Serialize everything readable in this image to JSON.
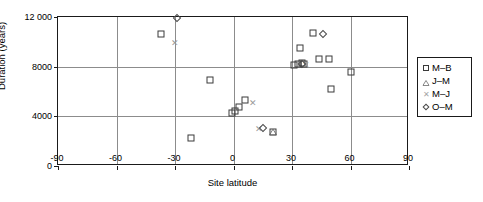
{
  "chart_data": {
    "type": "scatter",
    "title": "",
    "xlabel": "Site latitude",
    "ylabel": "Duration (years)",
    "xlim": [
      -90,
      90
    ],
    "ylim": [
      0,
      12000
    ],
    "xticks": [
      "-90",
      "-60",
      "-30",
      "0",
      "30",
      "60",
      "90"
    ],
    "xtick_values": [
      -90,
      -60,
      -30,
      0,
      30,
      60,
      90
    ],
    "yticks": [
      "0",
      "4000",
      "8000",
      "12 000"
    ],
    "ytick_values": [
      0,
      4000,
      8000,
      12000
    ],
    "grid": true,
    "legend_position": "right",
    "series": [
      {
        "name": "M–B",
        "marker": "square",
        "points": [
          [
            -37,
            10600
          ],
          [
            -22,
            2250
          ],
          [
            -12,
            6900
          ],
          [
            -1,
            4300
          ],
          [
            1,
            4450
          ],
          [
            3,
            4750
          ],
          [
            6,
            5300
          ],
          [
            20,
            2750
          ],
          [
            31,
            8150
          ],
          [
            33,
            8200
          ],
          [
            34,
            9500
          ],
          [
            35,
            8300
          ],
          [
            36,
            8200
          ],
          [
            41,
            10700
          ],
          [
            44,
            8600
          ],
          [
            49,
            8600
          ],
          [
            50,
            6200
          ],
          [
            60,
            7550
          ]
        ]
      },
      {
        "name": "J–M",
        "marker": "triangle",
        "points": [
          [
            20,
            2720
          ]
        ]
      },
      {
        "name": "M–J",
        "marker": "x",
        "points": [
          [
            -30,
            9900
          ],
          [
            10,
            5100
          ],
          [
            13,
            2950
          ],
          [
            37,
            8150
          ]
        ]
      },
      {
        "name": "O–M",
        "marker": "diamond",
        "points": [
          [
            -29,
            11950
          ],
          [
            15,
            3050
          ],
          [
            35,
            8250
          ],
          [
            46,
            10600
          ]
        ]
      }
    ]
  },
  "legend": {
    "entries": [
      {
        "label": "M–B",
        "marker": "square"
      },
      {
        "label": "J–M",
        "marker": "triangle"
      },
      {
        "label": "M–J",
        "marker": "x"
      },
      {
        "label": "O–M",
        "marker": "diamond"
      }
    ]
  },
  "colors": {
    "axis": "#1a1a1a",
    "grid": "#8c8c8c",
    "marker_dark": "#3a3a3a",
    "marker_light": "#9a9a9a",
    "background": "#ffffff"
  }
}
